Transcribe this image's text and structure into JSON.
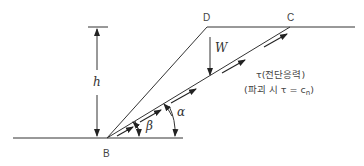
{
  "diagram": {
    "points": {
      "B": {
        "label": "B",
        "x": 107,
        "y": 138
      },
      "D": {
        "label": "D",
        "x": 207,
        "y": 27
      },
      "C": {
        "label": "C",
        "x": 290,
        "y": 27
      }
    },
    "labels": {
      "height": "h",
      "weight": "W",
      "alpha": "α",
      "beta": "β",
      "shear_stress_line1": "τ(전단응력)",
      "shear_stress_line2": "(파괴 시 τ = c",
      "shear_stress_subscript": "n",
      "shear_stress_close": ")"
    },
    "colors": {
      "line": "#333333",
      "background": "#ffffff"
    }
  }
}
